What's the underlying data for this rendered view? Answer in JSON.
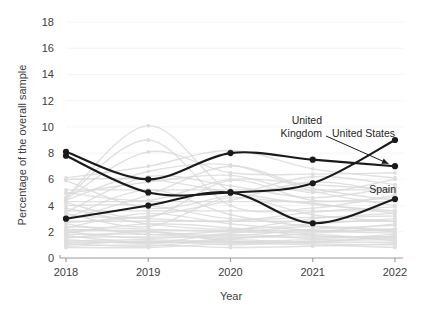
{
  "chart_data": {
    "type": "line",
    "title": "",
    "xlabel": "Year",
    "ylabel": "Percentage of the overall sample",
    "x": [
      2018,
      2019,
      2020,
      2021,
      2022
    ],
    "xtick_labels": [
      "2018",
      "2019",
      "2020",
      "2021",
      "2022"
    ],
    "ytick_labels": [
      "0",
      "2",
      "4",
      "6",
      "8",
      "10",
      "12",
      "14",
      "16",
      "18"
    ],
    "yticks": [
      0,
      2,
      4,
      6,
      8,
      10,
      12,
      14,
      16,
      18
    ],
    "ylim": [
      0,
      18
    ],
    "xlim": [
      2018,
      2022
    ],
    "grid": false,
    "legend": "none",
    "highlight_color": "#1a1a1a",
    "background_series_color": "#d9d9d9",
    "series": [
      {
        "name": "United Kingdom",
        "values": [
          8.1,
          6.0,
          8.0,
          7.5,
          7.0
        ],
        "highlight": true
      },
      {
        "name": "United States",
        "values": [
          7.8,
          5.0,
          5.0,
          5.7,
          9.0
        ],
        "highlight": true
      },
      {
        "name": "Spain",
        "values": [
          3.0,
          4.0,
          5.0,
          2.65,
          4.5
        ],
        "highlight": true
      }
    ],
    "background_series": [
      {
        "values": [
          6.1,
          7.0,
          8.2,
          6.8,
          6.1
        ]
      },
      {
        "values": [
          5.2,
          5.2,
          5.2,
          5.2,
          5.2
        ]
      },
      {
        "values": [
          4.6,
          10.1,
          5.1,
          4.2,
          3.4
        ]
      },
      {
        "values": [
          4.6,
          9.0,
          4.0,
          3.8,
          4.8
        ]
      },
      {
        "values": [
          4.5,
          8.1,
          6.5,
          6.4,
          6.5
        ]
      },
      {
        "values": [
          4.4,
          6.6,
          7.1,
          5.1,
          4.0
        ]
      },
      {
        "values": [
          4.3,
          4.3,
          4.3,
          4.3,
          4.3
        ]
      },
      {
        "values": [
          4.2,
          3.1,
          5.9,
          4.4,
          4.6
        ]
      },
      {
        "values": [
          4.0,
          4.0,
          3.0,
          3.1,
          3.2
        ]
      },
      {
        "values": [
          3.8,
          2.6,
          2.2,
          2.6,
          3.0
        ]
      },
      {
        "values": [
          3.6,
          3.6,
          3.6,
          3.6,
          3.6
        ]
      },
      {
        "values": [
          3.4,
          2.4,
          4.6,
          3.3,
          2.8
        ]
      },
      {
        "values": [
          3.2,
          3.0,
          2.8,
          3.5,
          3.9
        ]
      },
      {
        "values": [
          3.0,
          5.2,
          3.3,
          2.4,
          2.2
        ]
      },
      {
        "values": [
          2.8,
          2.8,
          2.8,
          2.8,
          2.8
        ]
      },
      {
        "values": [
          2.6,
          1.8,
          2.1,
          3.0,
          3.4
        ]
      },
      {
        "values": [
          2.4,
          2.2,
          2.0,
          2.0,
          2.6
        ]
      },
      {
        "values": [
          2.3,
          3.4,
          2.6,
          2.1,
          1.9
        ]
      },
      {
        "values": [
          2.2,
          2.0,
          1.7,
          2.2,
          2.5
        ]
      },
      {
        "values": [
          2.1,
          2.1,
          2.1,
          2.1,
          2.1
        ]
      },
      {
        "values": [
          2.0,
          1.5,
          1.9,
          2.4,
          2.0
        ]
      },
      {
        "values": [
          1.9,
          2.6,
          2.3,
          1.7,
          1.6
        ]
      },
      {
        "values": [
          1.8,
          1.8,
          1.5,
          1.9,
          2.2
        ]
      },
      {
        "values": [
          1.7,
          1.2,
          1.8,
          1.5,
          1.8
        ]
      },
      {
        "values": [
          1.6,
          1.6,
          1.6,
          1.6,
          1.6
        ]
      },
      {
        "values": [
          1.5,
          2.0,
          1.3,
          1.4,
          1.5
        ]
      },
      {
        "values": [
          1.4,
          1.1,
          1.5,
          1.8,
          1.3
        ]
      },
      {
        "values": [
          1.3,
          1.4,
          1.2,
          1.2,
          1.7
        ]
      },
      {
        "values": [
          1.2,
          1.2,
          1.2,
          1.2,
          1.2
        ]
      },
      {
        "values": [
          1.1,
          0.9,
          1.4,
          1.1,
          1.0
        ]
      },
      {
        "values": [
          1.0,
          1.3,
          1.0,
          1.3,
          1.4
        ]
      },
      {
        "values": [
          0.9,
          1.0,
          0.8,
          0.9,
          1.1
        ]
      },
      {
        "values": [
          0.8,
          0.8,
          1.1,
          1.0,
          0.8
        ]
      },
      {
        "values": [
          5.0,
          4.4,
          6.0,
          5.6,
          5.2
        ]
      },
      {
        "values": [
          5.9,
          3.8,
          4.8,
          6.2,
          5.6
        ]
      },
      {
        "values": [
          4.9,
          5.8,
          6.3,
          5.0,
          6.0
        ]
      },
      {
        "values": [
          3.5,
          6.2,
          5.5,
          4.6,
          5.4
        ]
      },
      {
        "values": [
          2.9,
          4.8,
          7.0,
          5.3,
          4.4
        ]
      },
      {
        "values": [
          2.7,
          3.2,
          4.4,
          5.8,
          5.0
        ]
      },
      {
        "values": [
          6.0,
          6.0,
          5.0,
          4.1,
          3.6
        ]
      }
    ],
    "annotations": [
      {
        "name": "united-kingdom",
        "lines": [
          "United",
          "Kingdom"
        ],
        "has_arrow": true
      },
      {
        "name": "united-states",
        "lines": [
          "United States"
        ],
        "has_arrow": false
      },
      {
        "name": "spain",
        "lines": [
          "Spain"
        ],
        "has_arrow": false
      }
    ]
  }
}
